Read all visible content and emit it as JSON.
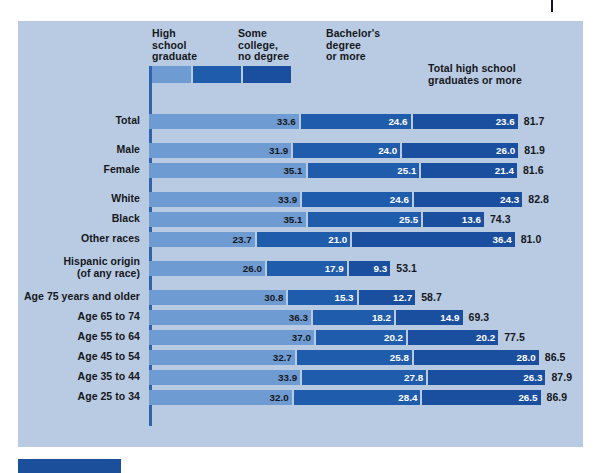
{
  "chart_data": {
    "type": "bar",
    "subtype": "stacked-horizontal",
    "title": "",
    "xlabel": "",
    "ylabel": "",
    "xlim": [
      0,
      90
    ],
    "grid": false,
    "legend_position": "top",
    "series": [
      {
        "name": "High school graduate",
        "color": "#6e9bd2"
      },
      {
        "name": "Some college, no degree",
        "color": "#1f5cab"
      },
      {
        "name": "Bachelor's degree or more",
        "color": "#1a4fa0"
      }
    ],
    "total_series_name": "Total high school graduates or more",
    "categories": [
      "Total",
      "Male",
      "Female",
      "White",
      "Black",
      "Other races",
      "Hispanic origin (of any race)",
      "Age 75 years and older",
      "Age 65 to 74",
      "Age 55 to 64",
      "Age 45 to 54",
      "Age 35 to 44",
      "Age 25 to 34"
    ],
    "values": {
      "High school graduate": [
        33.6,
        31.9,
        35.1,
        33.9,
        35.1,
        23.7,
        26.0,
        30.8,
        36.3,
        37.0,
        32.7,
        33.9,
        32.0
      ],
      "Some college, no degree": [
        24.6,
        24.0,
        25.1,
        24.6,
        25.5,
        21.0,
        17.9,
        15.3,
        18.2,
        20.2,
        25.8,
        27.8,
        28.4
      ],
      "Bachelor's degree or more": [
        23.6,
        26.0,
        21.4,
        24.3,
        13.6,
        36.4,
        9.3,
        12.7,
        14.9,
        20.2,
        28.0,
        26.3,
        26.5
      ]
    },
    "totals": [
      81.7,
      81.9,
      81.6,
      82.8,
      74.3,
      81.0,
      53.1,
      58.7,
      69.3,
      77.5,
      86.5,
      87.9,
      86.9
    ]
  },
  "legend": {
    "labels": [
      "High\nschool\ngraduate",
      "Some\ncollege,\nno degree",
      "Bachelor's\ndegree\nor more"
    ],
    "total_label": "Total high school\ngraduates or more",
    "sample_widths": [
      42,
      48,
      48
    ]
  },
  "rows": [
    {
      "label": "Total",
      "segments": [
        "33.6",
        "24.6",
        "23.6"
      ],
      "total": "81.7",
      "group": 0
    },
    {
      "label": "Male",
      "segments": [
        "31.9",
        "24.0",
        "26.0"
      ],
      "total": "81.9",
      "group": 1
    },
    {
      "label": "Female",
      "segments": [
        "35.1",
        "25.1",
        "21.4"
      ],
      "total": "81.6",
      "group": 1
    },
    {
      "label": "White",
      "segments": [
        "33.9",
        "24.6",
        "24.3"
      ],
      "total": "82.8",
      "group": 2
    },
    {
      "label": "Black",
      "segments": [
        "35.1",
        "25.5",
        "13.6"
      ],
      "total": "74.3",
      "group": 2
    },
    {
      "label": "Other races",
      "segments": [
        "23.7",
        "21.0",
        "36.4"
      ],
      "total": "81.0",
      "group": 2
    },
    {
      "label": "Hispanic origin\n(of any race)",
      "segments": [
        "26.0",
        "17.9",
        "9.3"
      ],
      "total": "53.1",
      "group": 3
    },
    {
      "label": "Age 75 years and older",
      "segments": [
        "30.8",
        "15.3",
        "12.7"
      ],
      "total": "58.7",
      "group": 4
    },
    {
      "label": "Age 65 to 74",
      "segments": [
        "36.3",
        "18.2",
        "14.9"
      ],
      "total": "69.3",
      "group": 4
    },
    {
      "label": "Age 55 to 64",
      "segments": [
        "37.0",
        "20.2",
        "20.2"
      ],
      "total": "77.5",
      "group": 4
    },
    {
      "label": "Age 45 to 54",
      "segments": [
        "32.7",
        "25.8",
        "28.0"
      ],
      "total": "86.5",
      "group": 4
    },
    {
      "label": "Age 35 to 44",
      "segments": [
        "33.9",
        "27.8",
        "26.3"
      ],
      "total": "87.9",
      "group": 4
    },
    {
      "label": "Age 25 to 34",
      "segments": [
        "32.0",
        "28.4",
        "26.5"
      ],
      "total": "86.9",
      "group": 4
    }
  ],
  "colors": {
    "panel_background": "#b8cbe3",
    "page_background": "#ffffff",
    "axis": "#2f63ad",
    "segment_1": "#6e9bd2",
    "segment_2": "#1f5cab",
    "segment_3": "#1a4fa0",
    "text": "#16171c",
    "value_text_light": "#ffffff",
    "bottom_block": "#1b4f9c"
  },
  "layout": {
    "px_per_unit": 4.46,
    "bar_left": 131,
    "row_height": 15,
    "row_gap": 5,
    "group_gap": 14,
    "first_row_top": 93
  }
}
